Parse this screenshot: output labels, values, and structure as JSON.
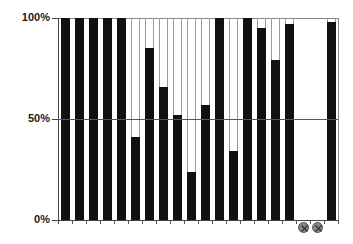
{
  "chart_data": {
    "type": "bar",
    "title": "",
    "xlabel": "",
    "ylabel": "",
    "ylim": [
      0,
      100
    ],
    "y_ticks": [
      "0%",
      "50%",
      "100%"
    ],
    "grid": "horizontal line at 50%",
    "legend": null,
    "categories": [
      "1",
      "2",
      "3",
      "4",
      "5",
      "6",
      "7",
      "8",
      "9",
      "10",
      "11",
      "12",
      "13",
      "14",
      "15",
      "16",
      "17",
      "18",
      "19",
      "20"
    ],
    "values": [
      100,
      100,
      100,
      100,
      100,
      41,
      85,
      66,
      52,
      24,
      57,
      100,
      34,
      100,
      95,
      79,
      97,
      null,
      null,
      98
    ],
    "missing_markers": [
      18,
      19
    ],
    "missing_marker_symbol": "⊗",
    "bar_color": "#111111",
    "frame_color": "#999999"
  },
  "axis": {
    "y_top_label": "100%",
    "y_mid_label": "50%",
    "y_bottom_label": "0%"
  }
}
